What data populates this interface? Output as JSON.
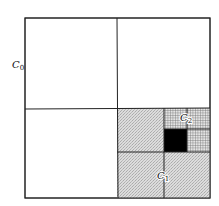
{
  "diagram": {
    "type": "quadtree-subdivision",
    "labels": {
      "c0": {
        "base": "C",
        "sub": "0"
      },
      "c1": {
        "base": "C",
        "sub": "1"
      },
      "c2": {
        "base": "C",
        "sub": "2"
      }
    },
    "colors": {
      "line": "#222222",
      "background": "#ffffff",
      "level1_fill": "#d9d9d9",
      "level2_fill": "#bdbdbd",
      "leaf_fill": "#000000"
    },
    "levels": [
      {
        "name": "C0",
        "cells": 4,
        "filled": "none"
      },
      {
        "name": "C1",
        "cells": 4,
        "filled": "lower-right quadrant of C0 (stippled)"
      },
      {
        "name": "C2",
        "cells": 4,
        "filled": "upper-right quadrant of C1 (cross-hatched)"
      },
      {
        "name": "leaf",
        "cells": 1,
        "filled": "lower-left cell of C2 (solid black)"
      }
    ]
  }
}
